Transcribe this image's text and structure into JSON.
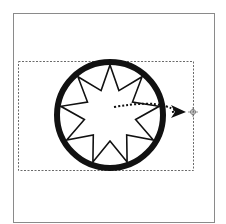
{
  "canvas": {
    "width": 226,
    "height": 224,
    "background": "#ffffff"
  },
  "frame": {
    "x": 13,
    "y": 13,
    "width": 201,
    "height": 209,
    "stroke": "#8a8a8a"
  },
  "selection_box": {
    "x": 18,
    "y": 61,
    "width": 175,
    "height": 109,
    "stroke": "#6a6a6a",
    "dash": "2,1.5"
  },
  "circle": {
    "cx": 110,
    "cy": 115,
    "r": 53,
    "stroke": "#111111",
    "stroke_width": 6
  },
  "star": {
    "cx": 110,
    "cy": 115,
    "points": 9,
    "outer_r": 50,
    "inner_r": 26,
    "stroke": "#111111",
    "stroke_width": 1.6
  },
  "motion_path": {
    "x1": 114,
    "y1": 107,
    "x2": 165,
    "y2": 105,
    "stroke": "#111111",
    "dash": "2,2"
  },
  "arrow_head": {
    "tip_x": 186,
    "tip_y": 112
  },
  "anchor_handle": {
    "x": 193,
    "y": 112
  }
}
